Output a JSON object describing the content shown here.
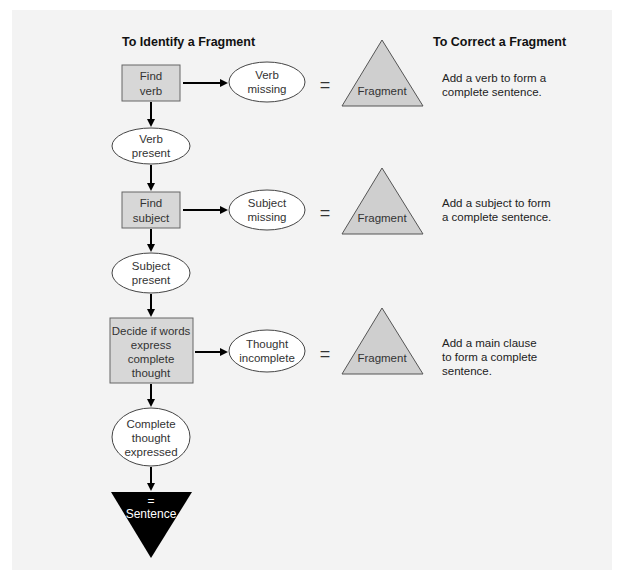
{
  "headings": {
    "identify": "To Identify a Fragment",
    "correct": "To Correct a Fragment"
  },
  "flow": {
    "step1": {
      "line1": "Find",
      "line2": "verb"
    },
    "step1_missing": {
      "line1": "Verb",
      "line2": "missing"
    },
    "step1_present": {
      "line1": "Verb",
      "line2": "present"
    },
    "step2": {
      "line1": "Find",
      "line2": "subject"
    },
    "step2_missing": {
      "line1": "Subject",
      "line2": "missing"
    },
    "step2_present": {
      "line1": "Subject",
      "line2": "present"
    },
    "step3": {
      "line1": "Decide if words",
      "line2": "express",
      "line3": "complete",
      "line4": "thought"
    },
    "step3_missing": {
      "line1": "Thought",
      "line2": "incomplete"
    },
    "step3_present": {
      "line1": "Complete",
      "line2": "thought",
      "line3": "expressed"
    },
    "result": {
      "equals": "=",
      "label": "Sentence"
    }
  },
  "equals_sign": "=",
  "fragment_label": "Fragment",
  "corrections": [
    {
      "line1": "Add a verb to form a",
      "line2": "complete sentence."
    },
    {
      "line1": "Add a subject to form",
      "line2": "a complete sentence."
    },
    {
      "line1": "Add a main clause",
      "line2": "to form a complete",
      "line3": "sentence."
    }
  ],
  "colors": {
    "panel_bg": "#f3f3f3",
    "box_fill": "#d7d7d7",
    "fragment_fill": "#cfcfcf",
    "sentence_fill": "#000000"
  }
}
